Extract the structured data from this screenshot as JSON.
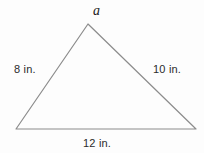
{
  "figure": {
    "type": "triangle-diagram",
    "background_color": "#fdfdfd",
    "stroke_color": "#8c8c8c",
    "text_color": "#2b2b2b",
    "labels": {
      "apex": "a",
      "left_side": "8 in.",
      "right_side": "10 in.",
      "bottom_side": "12 in."
    },
    "vertices": {
      "apex": {
        "x": 88,
        "y": 24
      },
      "bottom_left": {
        "x": 16,
        "y": 129
      },
      "bottom_right": {
        "x": 196,
        "y": 129
      }
    },
    "measurements": [
      {
        "side": "left",
        "value": 8,
        "unit": "in."
      },
      {
        "side": "right",
        "value": 10,
        "unit": "in."
      },
      {
        "side": "bottom",
        "value": 12,
        "unit": "in."
      }
    ],
    "unknown": {
      "name": "a",
      "position": "apex-angle"
    }
  }
}
